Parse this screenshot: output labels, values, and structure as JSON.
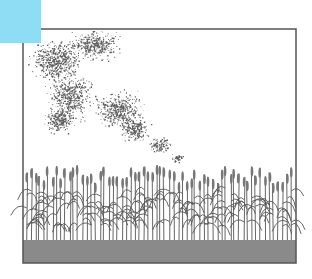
{
  "canvas": {
    "width": 312,
    "height": 279,
    "background": "#ffffff"
  },
  "corner_block": {
    "color": "#8fdcf5",
    "x": 0,
    "y": 0,
    "w": 41,
    "h": 43
  },
  "frame": {
    "x": 23,
    "y": 29,
    "w": 273,
    "h": 234,
    "stroke": "#555555",
    "stroke_width": 1.5
  },
  "cloud": {
    "description": "stippled swarm / dust cloud",
    "dot_color": "#3a3a3a",
    "blobs": [
      {
        "cx": 55,
        "cy": 60,
        "rx": 30,
        "ry": 25,
        "n": 520
      },
      {
        "cx": 95,
        "cy": 45,
        "rx": 30,
        "ry": 18,
        "n": 360
      },
      {
        "cx": 70,
        "cy": 95,
        "rx": 28,
        "ry": 28,
        "n": 480
      },
      {
        "cx": 60,
        "cy": 120,
        "rx": 20,
        "ry": 15,
        "n": 240
      },
      {
        "cx": 118,
        "cy": 110,
        "rx": 30,
        "ry": 22,
        "n": 420
      },
      {
        "cx": 135,
        "cy": 130,
        "rx": 18,
        "ry": 15,
        "n": 200
      },
      {
        "cx": 160,
        "cy": 145,
        "rx": 14,
        "ry": 10,
        "n": 110
      },
      {
        "cx": 178,
        "cy": 158,
        "rx": 8,
        "ry": 5,
        "n": 40
      }
    ]
  },
  "crop": {
    "description": "row of grain stalks",
    "stalk_color": "#555555",
    "head_color": "#777777",
    "count": 62,
    "x_start": 25,
    "x_end": 294,
    "top_min": 165,
    "top_max": 185,
    "base_y": 242
  },
  "ground": {
    "y": 240,
    "h": 23,
    "color": "#8a8a8a"
  }
}
